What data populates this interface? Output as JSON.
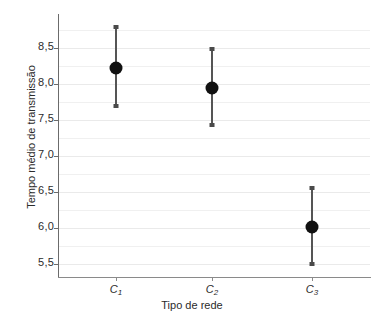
{
  "chart_data": {
    "type": "scatter",
    "title": "",
    "xlabel": "Tipo de rede",
    "ylabel": "Tempo médio de transmissão",
    "categories": [
      "C1",
      "C2",
      "C3"
    ],
    "category_labels": [
      {
        "base": "C",
        "sub": "1"
      },
      {
        "base": "C",
        "sub": "2"
      },
      {
        "base": "C",
        "sub": "3"
      }
    ],
    "values": [
      8.22,
      7.94,
      6.02
    ],
    "error_upper": [
      8.82,
      8.51,
      6.58
    ],
    "error_lower": [
      7.66,
      7.4,
      5.47
    ],
    "ylim": [
      5.32,
      8.97
    ],
    "yticks": [
      5.5,
      6.0,
      6.5,
      7.0,
      7.5,
      8.0,
      8.5
    ],
    "ytick_labels": [
      "5,5",
      "6,0",
      "6,5",
      "7,0",
      "7,5",
      "8,0",
      "8,5"
    ],
    "grid": true,
    "legend": "none",
    "marker_color": "#111111",
    "error_color": "#555555",
    "grid_color": "#f0f0f0",
    "axis_color": "#6b6b6b",
    "background": "#ffffff"
  },
  "points": [
    {
      "label_base": "C",
      "label_sub": "1",
      "mean": "8,22",
      "upper": "8,82",
      "lower": "7,66"
    },
    {
      "label_base": "C",
      "label_sub": "2",
      "mean": "7,94",
      "upper": "8,51",
      "lower": "7,40"
    },
    {
      "label_base": "C",
      "label_sub": "3",
      "mean": "6,02",
      "upper": "6,58",
      "lower": "5,47"
    }
  ],
  "axes": {
    "x_title": "Tipo de rede",
    "y_title": "Tempo médio de transmissão",
    "y_labels": [
      "8,5",
      "8,0",
      "7,5",
      "7,0",
      "6,5",
      "6,0",
      "5,5"
    ]
  }
}
